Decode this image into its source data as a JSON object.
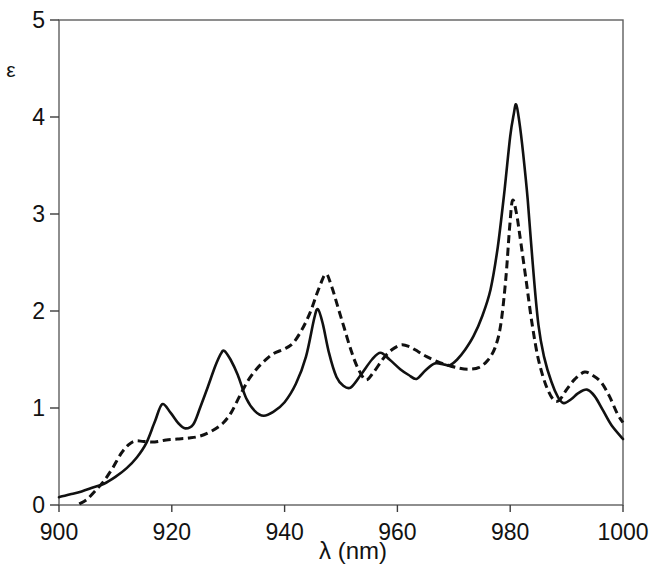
{
  "chart_data": {
    "type": "line",
    "title": "",
    "xlabel": "λ (nm)",
    "ylabel": "ε",
    "xlim": [
      900,
      1000
    ],
    "ylim": [
      0,
      5
    ],
    "xticks": [
      900,
      920,
      940,
      960,
      980,
      1000
    ],
    "yticks": [
      0,
      1,
      2,
      3,
      4,
      5
    ],
    "grid": false,
    "legend": "none",
    "frame": "full-box",
    "series": [
      {
        "name": "solid-spectrum",
        "line_style": "solid",
        "color": "#111111",
        "points": [
          [
            900,
            0.08
          ],
          [
            902,
            0.11
          ],
          [
            904,
            0.14
          ],
          [
            906,
            0.18
          ],
          [
            908,
            0.22
          ],
          [
            910,
            0.29
          ],
          [
            912,
            0.38
          ],
          [
            913.8,
            0.49
          ],
          [
            915.5,
            0.64
          ],
          [
            917,
            0.86
          ],
          [
            918.3,
            1.04
          ],
          [
            919.8,
            0.95
          ],
          [
            921.2,
            0.84
          ],
          [
            922.4,
            0.79
          ],
          [
            923.8,
            0.83
          ],
          [
            925,
            1.0
          ],
          [
            926.4,
            1.22
          ],
          [
            927.7,
            1.43
          ],
          [
            928.7,
            1.56
          ],
          [
            929.3,
            1.59
          ],
          [
            930.4,
            1.5
          ],
          [
            931.7,
            1.34
          ],
          [
            933.2,
            1.1
          ],
          [
            934.7,
            0.97
          ],
          [
            936.3,
            0.92
          ],
          [
            938,
            0.96
          ],
          [
            940,
            1.06
          ],
          [
            942,
            1.25
          ],
          [
            943.8,
            1.53
          ],
          [
            945.2,
            1.91
          ],
          [
            945.9,
            2.02
          ],
          [
            946.8,
            1.86
          ],
          [
            947.9,
            1.56
          ],
          [
            949.2,
            1.32
          ],
          [
            950.4,
            1.23
          ],
          [
            951.7,
            1.21
          ],
          [
            953.5,
            1.34
          ],
          [
            955.5,
            1.5
          ],
          [
            957,
            1.57
          ],
          [
            958.6,
            1.5
          ],
          [
            960.5,
            1.4
          ],
          [
            962,
            1.34
          ],
          [
            963.4,
            1.3
          ],
          [
            965,
            1.39
          ],
          [
            966.6,
            1.46
          ],
          [
            968.2,
            1.45
          ],
          [
            969.3,
            1.44
          ],
          [
            970.6,
            1.5
          ],
          [
            972,
            1.6
          ],
          [
            973.5,
            1.74
          ],
          [
            975,
            1.94
          ],
          [
            976.5,
            2.22
          ],
          [
            977.8,
            2.66
          ],
          [
            979,
            3.25
          ],
          [
            980,
            3.8
          ],
          [
            980.6,
            4.02
          ],
          [
            981.05,
            4.13
          ],
          [
            981.6,
            3.96
          ],
          [
            982.3,
            3.62
          ],
          [
            983.1,
            3.15
          ],
          [
            984,
            2.48
          ],
          [
            985,
            1.86
          ],
          [
            986,
            1.53
          ],
          [
            987.3,
            1.27
          ],
          [
            988.5,
            1.11
          ],
          [
            989.5,
            1.05
          ],
          [
            990.8,
            1.09
          ],
          [
            992,
            1.15
          ],
          [
            993.6,
            1.19
          ],
          [
            995,
            1.12
          ],
          [
            996.5,
            0.97
          ],
          [
            998,
            0.82
          ],
          [
            1000,
            0.68
          ]
        ]
      },
      {
        "name": "dashed-spectrum",
        "line_style": "dashed",
        "color": "#111111",
        "points": [
          [
            903.6,
            0.01
          ],
          [
            905,
            0.06
          ],
          [
            906.5,
            0.15
          ],
          [
            908,
            0.25
          ],
          [
            909.5,
            0.38
          ],
          [
            911,
            0.53
          ],
          [
            912.3,
            0.62
          ],
          [
            913.5,
            0.66
          ],
          [
            915,
            0.655
          ],
          [
            917,
            0.65
          ],
          [
            919,
            0.67
          ],
          [
            921,
            0.68
          ],
          [
            923,
            0.69
          ],
          [
            925,
            0.71
          ],
          [
            927,
            0.76
          ],
          [
            929,
            0.84
          ],
          [
            930.5,
            0.95
          ],
          [
            932,
            1.12
          ],
          [
            933.5,
            1.28
          ],
          [
            935,
            1.4
          ],
          [
            936.5,
            1.49
          ],
          [
            938,
            1.56
          ],
          [
            940,
            1.61
          ],
          [
            941.5,
            1.67
          ],
          [
            943,
            1.8
          ],
          [
            944.5,
            1.98
          ],
          [
            946,
            2.22
          ],
          [
            947.3,
            2.38
          ],
          [
            948.3,
            2.26
          ],
          [
            949.5,
            2.03
          ],
          [
            950.6,
            1.82
          ],
          [
            951.8,
            1.59
          ],
          [
            953,
            1.41
          ],
          [
            954.4,
            1.29
          ],
          [
            955.8,
            1.37
          ],
          [
            957.5,
            1.51
          ],
          [
            959,
            1.6
          ],
          [
            960.7,
            1.65
          ],
          [
            962.2,
            1.63
          ],
          [
            963.7,
            1.58
          ],
          [
            965.2,
            1.53
          ],
          [
            967,
            1.48
          ],
          [
            969,
            1.44
          ],
          [
            971,
            1.41
          ],
          [
            972.8,
            1.4
          ],
          [
            974.5,
            1.42
          ],
          [
            976,
            1.49
          ],
          [
            977.3,
            1.62
          ],
          [
            978.3,
            1.85
          ],
          [
            979.2,
            2.32
          ],
          [
            979.9,
            2.86
          ],
          [
            980.4,
            3.14
          ],
          [
            981.1,
            3.01
          ],
          [
            981.9,
            2.7
          ],
          [
            982.9,
            2.28
          ],
          [
            983.9,
            1.86
          ],
          [
            985,
            1.5
          ],
          [
            986.3,
            1.24
          ],
          [
            987.6,
            1.09
          ],
          [
            988.7,
            1.08
          ],
          [
            990,
            1.19
          ],
          [
            991.5,
            1.3
          ],
          [
            993.2,
            1.37
          ],
          [
            994.8,
            1.33
          ],
          [
            996.2,
            1.26
          ],
          [
            997.6,
            1.12
          ],
          [
            999,
            0.94
          ],
          [
            1000,
            0.85
          ]
        ]
      }
    ]
  },
  "style": {
    "background": "#ffffff",
    "frame_color": "#5f5f5f",
    "tick_color": "#3c3c3c",
    "text_color": "#121212",
    "curve_color": "#111111"
  }
}
